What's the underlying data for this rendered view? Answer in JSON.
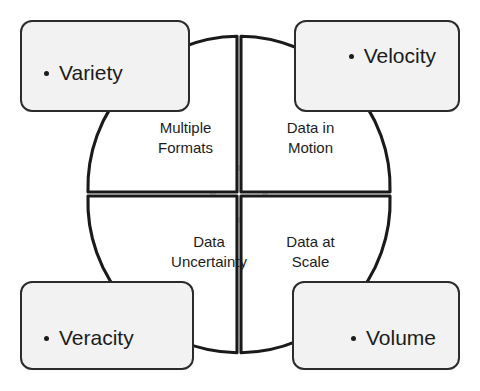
{
  "diagram": {
    "colors": {
      "box_fill": "#f2f2f2",
      "box_stroke": "#2b2b2b",
      "quadrant_stroke": "#1a1a1a",
      "quadrant_fill": "#ffffff",
      "center_ring": "#d8d8d8",
      "background": "#ffffff",
      "text": "#1c1c1c"
    },
    "corner_boxes": [
      {
        "id": "variety",
        "label": "Variety",
        "position": "top-left"
      },
      {
        "id": "velocity",
        "label": "Velocity",
        "position": "top-right"
      },
      {
        "id": "veracity",
        "label": "Veracity",
        "position": "bottom-left"
      },
      {
        "id": "volume",
        "label": "Volume",
        "position": "bottom-right"
      }
    ],
    "quadrants": [
      {
        "id": "multiple-formats",
        "label": "Multiple\nFormats",
        "position": "top-left",
        "pairs_with": "variety"
      },
      {
        "id": "data-in-motion",
        "label": "Data in\nMotion",
        "position": "top-right",
        "pairs_with": "velocity"
      },
      {
        "id": "data-uncertainty",
        "label": "Data\nUncertainty",
        "position": "bottom-left",
        "pairs_with": "veracity"
      },
      {
        "id": "data-at-scale",
        "label": "Data at\nScale",
        "position": "bottom-right",
        "pairs_with": "volume"
      }
    ],
    "center": {
      "id": "center-ring",
      "shape": "ring",
      "radius": 26
    },
    "geometry": {
      "circle_center_x": 239,
      "circle_center_y": 194,
      "circle_radius": 151,
      "quadrant_gap": 4
    }
  }
}
